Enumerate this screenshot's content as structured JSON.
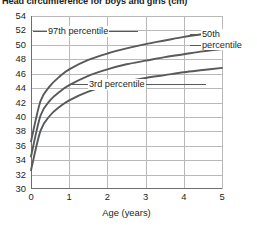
{
  "chart_data": {
    "type": "line",
    "title": "Head circumference for boys and girls (cm)",
    "xlabel": "Age (years)",
    "ylabel": "",
    "xlim": [
      0,
      5
    ],
    "ylim": [
      30,
      54
    ],
    "grid": true,
    "legend_position": "inline-annotations",
    "x_ticks": [
      "0",
      "1",
      "2",
      "3",
      "4",
      "5"
    ],
    "y_ticks": [
      "30",
      "32",
      "34",
      "36",
      "38",
      "40",
      "42",
      "44",
      "46",
      "48",
      "50",
      "52",
      "54"
    ],
    "x": [
      0,
      0.25,
      0.5,
      0.75,
      1,
      1.5,
      2,
      2.5,
      3,
      3.5,
      4,
      4.5,
      5
    ],
    "series": [
      {
        "name": "97th percentile",
        "annotation": "97th percentile",
        "color": "#58595b",
        "values": [
          36.6,
          42.2,
          44.3,
          45.6,
          46.6,
          47.9,
          48.8,
          49.5,
          50.1,
          50.6,
          51.1,
          51.5,
          51.9
        ]
      },
      {
        "name": "50th percentile",
        "annotation": "50th percentile",
        "color": "#58595b",
        "values": [
          34.5,
          40.2,
          42.3,
          43.5,
          44.4,
          45.7,
          46.6,
          47.3,
          47.8,
          48.3,
          48.7,
          49.1,
          49.4
        ]
      },
      {
        "name": "3rd percentile",
        "annotation": "3rd percentile",
        "color": "#58595b",
        "values": [
          32.6,
          38.1,
          40.2,
          41.4,
          42.3,
          43.5,
          44.3,
          44.9,
          45.4,
          45.8,
          46.2,
          46.5,
          46.8
        ]
      }
    ]
  },
  "annotations": {
    "p97": "97th percentile",
    "p3": "3rd percentile",
    "p50_line1": "50th",
    "p50_line2": "percentile"
  }
}
